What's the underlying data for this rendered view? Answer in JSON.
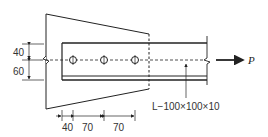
{
  "diagram": {
    "type": "bolted angle connection to gusset plate",
    "member_label": "L−100×100×10",
    "load_label": "P",
    "left_dimensions": [
      "40",
      "60"
    ],
    "bottom_dimensions": [
      "40",
      "70",
      "70"
    ],
    "bolt_count": 3,
    "colors": {
      "line": "#222222",
      "background": "#ffffff"
    }
  }
}
